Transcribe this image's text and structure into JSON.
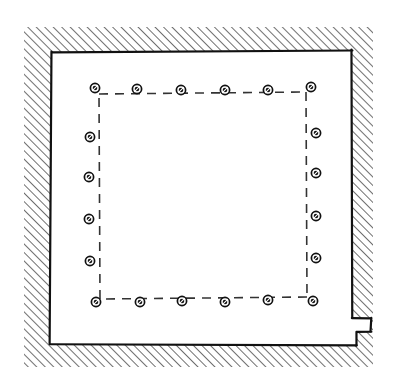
{
  "document": {
    "title": "Hand-drawn architectural floor plan",
    "kind": "line-drawing",
    "background_color": "#ffffff",
    "ink_color": "#1a1a1a"
  },
  "canvas": {
    "width": 398,
    "height": 389
  },
  "wall": {
    "label": "Hatched masonry wall",
    "hatch_color": "#222222",
    "hatch_angle_deg": 45,
    "hatch_spacing_px": 6,
    "hatch_line_width_px": 1.3,
    "outer_outline": [
      [
        24,
        27
      ],
      [
        373,
        27
      ],
      [
        373,
        367
      ],
      [
        24,
        367
      ]
    ],
    "inner_outline": [
      [
        52,
        52
      ],
      [
        352,
        50
      ],
      [
        352,
        318
      ],
      [
        371,
        318
      ],
      [
        371,
        332
      ],
      [
        357,
        332
      ],
      [
        357,
        345
      ],
      [
        50,
        344
      ]
    ],
    "outline_color": "#111111",
    "outline_width_px": 2.2
  },
  "room": {
    "label": "Room interior",
    "fill_color": "#ffffff"
  },
  "dashed_rect": {
    "label": "Dashed setback outline",
    "color": "#333333",
    "line_width_px": 1.6,
    "dash_px": 9,
    "gap_px": 7,
    "points": [
      [
        99,
        94
      ],
      [
        306,
        92
      ],
      [
        307,
        297
      ],
      [
        100,
        299
      ]
    ]
  },
  "markers": {
    "label": "Post / anchor markers",
    "glyph": "circle-with-slash",
    "outer_radius_px": 4.6,
    "inner_radius_px": 2.3,
    "ring_color": "#111111",
    "core_color": "#111111",
    "highlight_color": "#ffffff",
    "count": 24,
    "rows": {
      "top": {
        "label": "Top row",
        "count": 6,
        "points": [
          [
            95,
            88
          ],
          [
            137,
            89
          ],
          [
            181,
            90
          ],
          [
            225,
            90
          ],
          [
            268,
            90
          ],
          [
            311,
            87
          ]
        ]
      },
      "bottom": {
        "label": "Bottom row",
        "count": 6,
        "points": [
          [
            96,
            302
          ],
          [
            140,
            302
          ],
          [
            182,
            301
          ],
          [
            225,
            302
          ],
          [
            268,
            300
          ],
          [
            313,
            301
          ]
        ]
      },
      "left": {
        "label": "Left column",
        "count": 4,
        "points": [
          [
            90,
            137
          ],
          [
            89,
            177
          ],
          [
            89,
            219
          ],
          [
            90,
            261
          ]
        ]
      },
      "right": {
        "label": "Right column",
        "count": 4,
        "points": [
          [
            316,
            133
          ],
          [
            316,
            173
          ],
          [
            316,
            216
          ],
          [
            316,
            258
          ]
        ]
      }
    }
  }
}
